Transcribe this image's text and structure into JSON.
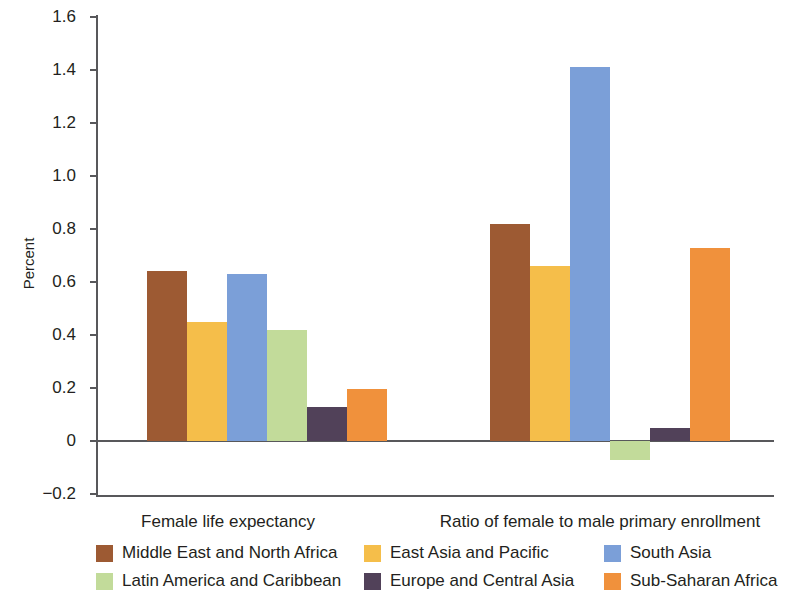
{
  "chart_data": {
    "type": "bar",
    "title": "",
    "xlabel": "",
    "ylabel": "Percent",
    "ylim": [
      -0.2,
      1.6
    ],
    "yticks": [
      1.6,
      1.4,
      1.2,
      1.0,
      0.8,
      0.6,
      0.4,
      0.2,
      0,
      -0.2
    ],
    "ytick_labels": [
      "1.6",
      "1.4",
      "1.2",
      "1.0",
      "0.8",
      "0.6",
      "0.4",
      "0.2",
      "0",
      "−0.2"
    ],
    "grid": false,
    "legend_position": "bottom",
    "categories": [
      "Female life expectancy",
      "Ratio of female to male primary enrollment"
    ],
    "series": [
      {
        "name": "Middle East and North Africa",
        "color": "#9d5a33",
        "values": [
          0.64,
          0.82
        ]
      },
      {
        "name": "East Asia and Pacific",
        "color": "#f5be4a",
        "values": [
          0.45,
          0.66
        ]
      },
      {
        "name": "South Asia",
        "color": "#7b9fd8",
        "values": [
          0.63,
          1.41
        ]
      },
      {
        "name": "Latin America and Caribbean",
        "color": "#c2db9a",
        "values": [
          0.42,
          -0.07
        ]
      },
      {
        "name": "Europe and Central Asia",
        "color": "#514159",
        "values": [
          0.13,
          0.05
        ]
      },
      {
        "name": "Sub-Saharan Africa",
        "color": "#f0913c",
        "values": [
          0.195,
          0.73
        ]
      }
    ]
  },
  "axis": {
    "y_label": "Percent",
    "ticks": [
      {
        "label": "1.6",
        "value": 1.6
      },
      {
        "label": "1.4",
        "value": 1.4
      },
      {
        "label": "1.2",
        "value": 1.2
      },
      {
        "label": "1.0",
        "value": 1.0
      },
      {
        "label": "0.8",
        "value": 0.8
      },
      {
        "label": "0.6",
        "value": 0.6
      },
      {
        "label": "0.4",
        "value": 0.4
      },
      {
        "label": "0.2",
        "value": 0.2
      },
      {
        "label": "0",
        "value": 0
      },
      {
        "label": "−0.2",
        "value": -0.2
      }
    ]
  },
  "groups": [
    {
      "label": "Female life expectancy"
    },
    {
      "label": "Ratio of female to male primary enrollment"
    }
  ],
  "legend": {
    "rows": [
      [
        {
          "label": "Middle East and North Africa",
          "color": "#9d5a33"
        },
        {
          "label": "East Asia and Pacific",
          "color": "#f5be4a"
        },
        {
          "label": "South Asia",
          "color": "#7b9fd8"
        }
      ],
      [
        {
          "label": "Latin America and Caribbean",
          "color": "#c2db9a"
        },
        {
          "label": "Europe and Central Asia",
          "color": "#514159"
        },
        {
          "label": "Sub-Saharan Africa",
          "color": "#f0913c"
        }
      ]
    ]
  }
}
